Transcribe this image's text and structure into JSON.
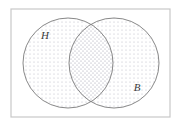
{
  "figure": {
    "kind": "venn-diagram",
    "width": 182,
    "height": 128,
    "background_color": "#ffffff"
  },
  "frame": {
    "name": "universal-set-rectangle",
    "x": 11,
    "y": 9,
    "width": 159,
    "height": 108,
    "stroke_color": "#c8c8c8",
    "stroke_width": 1.2,
    "fill": "none"
  },
  "circles": [
    {
      "id": "set-h",
      "label": "H",
      "cx": 68,
      "cy": 63,
      "r": 45,
      "stroke_color": "#7a7a7a",
      "stroke_width": 0.9,
      "fill_pattern": "dot-stipple",
      "fill_color": "#b9b9c4",
      "label_x": 45,
      "label_y": 39
    },
    {
      "id": "set-b",
      "label": "B",
      "cx": 114,
      "cy": 63,
      "r": 45,
      "stroke_color": "#7a7a7a",
      "stroke_width": 0.9,
      "fill_pattern": "dot-stipple",
      "fill_color": "#b9b9c4",
      "label_x": 137,
      "label_y": 91
    }
  ],
  "intersection": {
    "id": "set-h-and-b",
    "description": "overlap lens region with denser stipple",
    "fill_pattern": "dot-stipple-dense",
    "fill_color": "#a9a9b6",
    "crossing_top_x": 91,
    "crossing_top_y": 17,
    "crossing_bottom_x": 91,
    "crossing_bottom_y": 109
  },
  "stipple": {
    "tile_size": 4,
    "dot_radius": 0.55,
    "dot_color": "#b9b9c4",
    "dense_dot_color": "#9a9aa8"
  }
}
